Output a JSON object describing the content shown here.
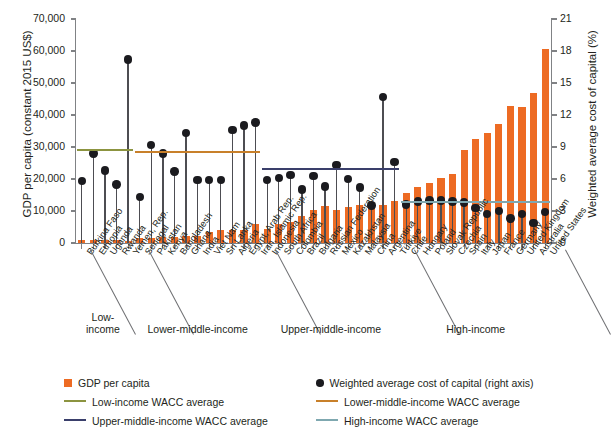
{
  "chart_data": {
    "type": "bar",
    "title": "",
    "ylabel": "GDP per capita (constant 2015 US$)",
    "y2label": "Weighted average cost of capital (%)",
    "xlabel": "",
    "ylim": [
      0,
      70000
    ],
    "y2lim": [
      0,
      21
    ],
    "yticks": [
      "0",
      "10,000",
      "20,000",
      "30,000",
      "40,000",
      "50,000",
      "60,000",
      "70,000"
    ],
    "ytick_values": [
      0,
      10000,
      20000,
      30000,
      40000,
      50000,
      60000,
      70000
    ],
    "y2ticks": [
      "0",
      "3",
      "6",
      "9",
      "12",
      "15",
      "18",
      "21"
    ],
    "y2tick_values": [
      0,
      3,
      6,
      9,
      12,
      15,
      18,
      21
    ],
    "grid": false,
    "legend_position": "below",
    "categories": [
      "Burkina Faso",
      "Ethiopia",
      "Uganda",
      "Rwanda",
      "Yemen, Rep.",
      "Senegal",
      "Pakistan",
      "Kenya",
      "Bangladesh",
      "Ghana",
      "India",
      "Viet Nam",
      "Sri Lanka",
      "Algeria",
      "Egypt, Arab Rep.",
      "Iran, Islamic Rep.",
      "Indonesia",
      "South Africa",
      "Colombia",
      "Brazil",
      "Bulgaria",
      "Russian Federation",
      "Mexico",
      "Kazakhstan",
      "Malaysia",
      "China",
      "Argentina",
      "Türkiye",
      "Chile",
      "Hungary",
      "Poland",
      "Slovak Republic",
      "Czechia",
      "Spain",
      "Italy",
      "Japan",
      "France",
      "Germany",
      "United Kingdom",
      "Australia",
      "United States"
    ],
    "series": [
      {
        "name": "GDP per capita",
        "axis": "left",
        "type": "bar",
        "color": "#ED6B23",
        "values": [
          820,
          930,
          1000,
          870,
          700,
          1560,
          1460,
          1880,
          1900,
          2320,
          2130,
          3520,
          4030,
          4100,
          4100,
          5800,
          4350,
          5950,
          6650,
          8300,
          10200,
          11600,
          10200,
          11200,
          11800,
          11900,
          11900,
          13000,
          15500,
          17400,
          18900,
          20400,
          21500,
          29200,
          32600,
          34400,
          37100,
          42800,
          42500,
          47000,
          60500
        ]
      },
      {
        "name": "Weighted average cost of capital (right axis)",
        "axis": "right",
        "type": "scatter",
        "color": "#1b1b1f",
        "values": [
          5.8,
          8.4,
          6.8,
          5.5,
          17.2,
          4.3,
          9.2,
          8.4,
          6.7,
          10.3,
          5.9,
          5.9,
          5.9,
          10.6,
          11.0,
          11.3,
          5.9,
          6.1,
          6.4,
          5.0,
          6.3,
          5.3,
          7.3,
          6.0,
          5.2,
          3.5,
          13.7,
          7.6,
          3.6,
          3.9,
          4.0,
          4.0,
          3.9,
          3.8,
          3.3,
          2.7,
          3.0,
          2.3,
          2.7,
          1.9,
          2.9
        ]
      }
    ],
    "average_lines": [
      {
        "name": "Low-income WACC average",
        "color": "#8C9440",
        "value": 8.8,
        "group": "Low-income"
      },
      {
        "name": "Lower-middle-income WACC average",
        "color": "#C8802A",
        "value": 8.65,
        "group": "Lower-middle-income"
      },
      {
        "name": "Upper-middle-income WACC average",
        "color": "#3A3F6B",
        "value": 7.0,
        "group": "Upper-middle-income"
      },
      {
        "name": "High-income WACC average",
        "color": "#7FA8B0",
        "value": 3.9,
        "group": "High-income"
      }
    ],
    "groups": [
      {
        "label": "Low-income",
        "start": 0,
        "end": 4
      },
      {
        "label": "Lower-middle-income",
        "start": 5,
        "end": 15
      },
      {
        "label": "Upper-middle-income",
        "start": 16,
        "end": 27
      },
      {
        "label": "High-income",
        "start": 28,
        "end": 40
      }
    ],
    "group_label_lines": [
      "Low-",
      "income"
    ]
  },
  "legend": {
    "items": [
      {
        "key": "gdp",
        "marker": "square",
        "label": "GDP per capita",
        "color": "#ED6B23"
      },
      {
        "key": "wacc",
        "marker": "circle",
        "label": "Weighted average cost of capital (right axis)",
        "color": "#1b1b1f"
      },
      {
        "key": "low",
        "marker": "line",
        "label": "Low-income WACC average",
        "color": "#8C9440"
      },
      {
        "key": "lowermid",
        "marker": "line",
        "label": "Lower-middle-income WACC average",
        "color": "#C8802A"
      },
      {
        "key": "uppermid",
        "marker": "line",
        "label": "Upper-middle-income WACC average",
        "color": "#3A3F6B"
      },
      {
        "key": "high",
        "marker": "line",
        "label": "High-income WACC average",
        "color": "#7FA8B0"
      }
    ]
  }
}
